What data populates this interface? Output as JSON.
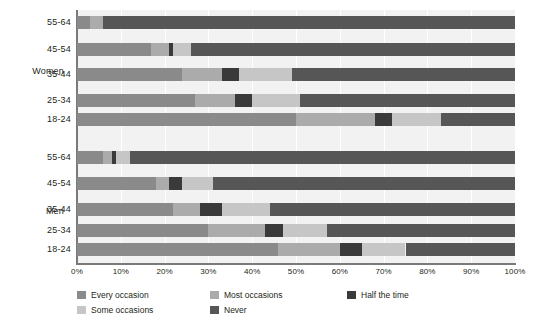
{
  "chart_data": {
    "type": "bar",
    "orientation": "horizontal",
    "stacked": true,
    "stack_mode": "percent",
    "title": "",
    "subtitle": "",
    "xlabel": "",
    "ylabel": "",
    "xlim": [
      0,
      100
    ],
    "xticks": [
      "0%",
      "10%",
      "20%",
      "30%",
      "40%",
      "50%",
      "60%",
      "70%",
      "80%",
      "90%",
      "100%"
    ],
    "xtick_values": [
      0,
      10,
      20,
      30,
      40,
      50,
      60,
      70,
      80,
      90,
      100
    ],
    "grid": true,
    "grid_axis": "x",
    "legend_position": "bottom",
    "groups": [
      "Women",
      "Men"
    ],
    "categories": [
      "55-64",
      "45-54",
      "35-44",
      "25-34",
      "18-24"
    ],
    "series": [
      {
        "name": "Every occasion",
        "color": "#8a8a8a"
      },
      {
        "name": "Most occasions",
        "color": "#ababab"
      },
      {
        "name": "Half the time",
        "color": "#3a3a3a"
      },
      {
        "name": "Some occasions",
        "color": "#c6c6c6"
      },
      {
        "name": "Never",
        "color": "#565656"
      }
    ],
    "rows": [
      {
        "group": "Women",
        "category": "55-64",
        "values": [
          3,
          3,
          0,
          0,
          94
        ]
      },
      {
        "group": "Women",
        "category": "45-54",
        "values": [
          17,
          4,
          1,
          4,
          74
        ]
      },
      {
        "group": "Women",
        "category": "35-44",
        "values": [
          24,
          9,
          4,
          12,
          51
        ]
      },
      {
        "group": "Women",
        "category": "25-34",
        "values": [
          27,
          9,
          4,
          11,
          49
        ]
      },
      {
        "group": "Women",
        "category": "18-24",
        "values": [
          50,
          18,
          4,
          11,
          17
        ]
      },
      {
        "group": "Men",
        "category": "55-64",
        "values": [
          6,
          2,
          1,
          3,
          88
        ]
      },
      {
        "group": "Men",
        "category": "45-54",
        "values": [
          18,
          3,
          3,
          7,
          69
        ]
      },
      {
        "group": "Men",
        "category": "35-44",
        "values": [
          22,
          6,
          5,
          11,
          56
        ]
      },
      {
        "group": "Men",
        "category": "25-34",
        "values": [
          30,
          13,
          4,
          10,
          43
        ]
      },
      {
        "group": "Men",
        "category": "18-24",
        "values": [
          46,
          14,
          5,
          10,
          25
        ]
      }
    ]
  },
  "legend": {
    "items": [
      {
        "label": "Every occasion",
        "color": "#8a8a8a"
      },
      {
        "label": "Most occasions",
        "color": "#ababab"
      },
      {
        "label": "Half the time",
        "color": "#3a3a3a"
      },
      {
        "label": "Some occasions",
        "color": "#c6c6c6"
      },
      {
        "label": "Never",
        "color": "#565656"
      }
    ]
  },
  "axis": {
    "ticks": [
      "0%",
      "10%",
      "20%",
      "30%",
      "40%",
      "50%",
      "60%",
      "70%",
      "80%",
      "90%",
      "100%"
    ]
  },
  "groups": {
    "women_label": "Women",
    "men_label": "Men"
  }
}
